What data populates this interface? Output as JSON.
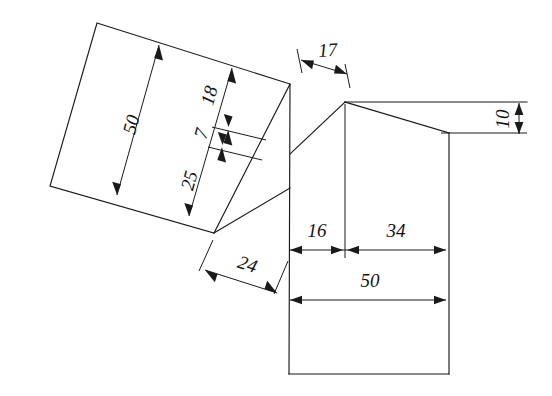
{
  "drawing": {
    "title": "Technical line drawing with dimensions",
    "units": "mm",
    "stroke_color": "#1a1a1a",
    "background_color": "#ffffff",
    "dimensions": {
      "left_panel_width": "50",
      "left_panel_segment_lower": "25",
      "left_panel_segment_middle": "7",
      "left_panel_segment_upper": "18",
      "bevel_offset": "24",
      "top_offset": "17",
      "right_flange_height": "10",
      "base_left_segment": "16",
      "base_right_segment": "34",
      "base_total_width": "50"
    }
  }
}
